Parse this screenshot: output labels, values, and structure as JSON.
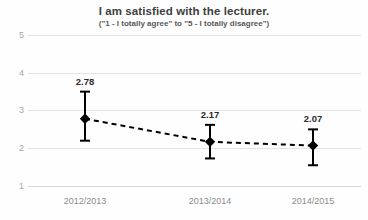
{
  "chart_data": {
    "type": "line",
    "title": "I am satisfied with the lecturer.",
    "subtitle": "(\"1 - I totally agree\" to \"5 - I totally disagree\")",
    "xlabel": "",
    "ylabel": "",
    "categories": [
      "2012/2013",
      "2013/2014",
      "2014/2015"
    ],
    "values": [
      2.78,
      2.17,
      2.07
    ],
    "point_labels": [
      "2.78",
      "2.17",
      "2.07"
    ],
    "error_bars": [
      {
        "low": 2.2,
        "high": 3.5
      },
      {
        "low": 1.73,
        "high": 2.62
      },
      {
        "low": 1.55,
        "high": 2.5
      }
    ],
    "ylim": [
      1,
      5
    ],
    "yticks": [
      1,
      2,
      3,
      4,
      5
    ],
    "ytick_labels": [
      "1",
      "2",
      "3",
      "4",
      "5"
    ],
    "grid": true,
    "legend": "none",
    "line_style": "dashed",
    "line_color": "#000000",
    "marker": "diamond",
    "marker_color": "#000000",
    "grid_color": "#e3e3e3",
    "background_color": "#fefefe"
  },
  "axes": {
    "y": {
      "tick_0": "5",
      "tick_1": "4",
      "tick_2": "3",
      "tick_3": "2",
      "tick_4": "1"
    },
    "x": {
      "tick_0": "2012/2013",
      "tick_1": "2013/2014",
      "tick_2": "2014/2015"
    }
  },
  "labels": {
    "point_0": "2.78",
    "point_1": "2.17",
    "point_2": "2.07"
  }
}
